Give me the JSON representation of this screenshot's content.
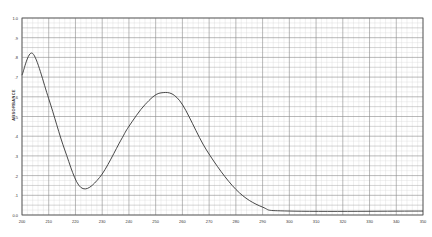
{
  "chart_data": {
    "type": "line",
    "title": "",
    "xlabel": "",
    "ylabel": "ABSORBANCE",
    "xlim": [
      200,
      350
    ],
    "ylim": [
      0.0,
      1.0
    ],
    "grid": true,
    "legend": null,
    "x_ticks": [
      "200",
      "210",
      "220",
      "230",
      "240",
      "250",
      "260",
      "270",
      "280",
      "290",
      "300",
      "310",
      "320",
      "330",
      "340",
      "350"
    ],
    "y_ticks": [
      "0.0",
      ".1",
      ".2",
      ".3",
      ".4",
      ".5",
      ".6",
      ".7",
      ".8",
      ".9",
      "1.0"
    ],
    "series": [
      {
        "name": "absorbance",
        "x": [
          200,
          204,
          210,
          216,
          222,
          229,
          237,
          240,
          246,
          252,
          259,
          269,
          280,
          290,
          300,
          350
        ],
        "values": [
          0.71,
          0.82,
          0.59,
          0.33,
          0.14,
          0.19,
          0.38,
          0.45,
          0.56,
          0.62,
          0.58,
          0.33,
          0.13,
          0.04,
          0.02,
          0.02
        ]
      }
    ],
    "colors": {
      "line": "#333333",
      "grid_major": "#8a8a8a",
      "grid_minor": "#d8d8d8",
      "background": "#ffffff"
    }
  }
}
